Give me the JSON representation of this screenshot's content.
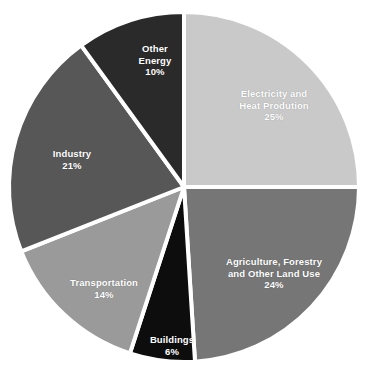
{
  "chart_data": {
    "type": "pie",
    "title": "",
    "subtitle": "",
    "xlabel": "",
    "ylabel": "",
    "units": "percent",
    "total": 100,
    "start_angle_deg": 0,
    "direction": "clockwise",
    "legend": "none",
    "grid": false,
    "categories": [
      "Electricity and Heat Prodution",
      "Agriculture, Forestry and Other Land Use",
      "Buildings",
      "Transportation",
      "Industry",
      "Other Energy"
    ],
    "values": [
      25,
      24,
      6,
      14,
      21,
      10
    ],
    "slices": [
      {
        "id": "electricity",
        "label_lines": [
          "Electricity and",
          "Heat Prodution"
        ],
        "value": 25,
        "value_text": "25%",
        "color": "#c9c9c9",
        "label_x": 274,
        "label_y": 105
      },
      {
        "id": "agriculture",
        "label_lines": [
          "Agriculture, Forestry",
          "and Other Land Use"
        ],
        "value": 24,
        "value_text": "24%",
        "color": "#767676",
        "label_x": 274,
        "label_y": 273
      },
      {
        "id": "buildings",
        "label_lines": [
          "Buildings"
        ],
        "value": 6,
        "value_text": "6%",
        "color": "#0d0d0d",
        "label_x": 172,
        "label_y": 345
      },
      {
        "id": "transportation",
        "label_lines": [
          "Transportation"
        ],
        "value": 14,
        "value_text": "14%",
        "color": "#9a9a9a",
        "label_x": 104,
        "label_y": 288
      },
      {
        "id": "industry",
        "label_lines": [
          "Industry"
        ],
        "value": 21,
        "value_text": "21%",
        "color": "#575757",
        "label_x": 72,
        "label_y": 159
      },
      {
        "id": "other-energy",
        "label_lines": [
          "Other",
          "Energy"
        ],
        "value": 10,
        "value_text": "10%",
        "color": "#2a2a2a",
        "label_x": 155,
        "label_y": 60
      }
    ],
    "geometry": {
      "center_x": 184,
      "center_y": 187,
      "radius": 175
    }
  }
}
